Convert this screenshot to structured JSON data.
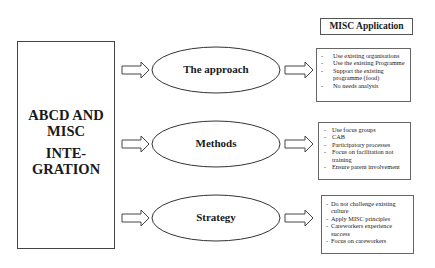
{
  "main": {
    "title_lines": [
      "ABCD AND",
      "MISC"
    ],
    "subtitle_lines": [
      "INTE-",
      "GRATION"
    ]
  },
  "header": {
    "label": "MISC Application"
  },
  "rows": [
    {
      "label": "The approach",
      "items": [
        "Use existing organisations",
        "Use the existing Programme",
        "Support the existing programme (food)",
        "No needs analysis"
      ]
    },
    {
      "label": "Methods",
      "items": [
        "Use focus groups",
        "CAB",
        "Participatory processes",
        "Focus on facilitation not training",
        "Ensure parent involvement"
      ]
    },
    {
      "label": "Strategy",
      "items": [
        "Do not challenge existing culture",
        "Apply MISC principles",
        "Careworkers experience success",
        "Focus on careworkers"
      ]
    }
  ],
  "bullet": "-"
}
